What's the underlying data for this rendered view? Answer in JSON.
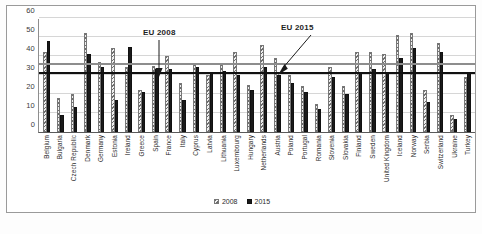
{
  "chart_data": {
    "type": "bar",
    "title": "",
    "xlabel": "",
    "ylabel": "",
    "ylim": [
      0,
      60
    ],
    "yticks": [
      0,
      10,
      20,
      30,
      40,
      50,
      60
    ],
    "grid": true,
    "legend_position": "bottom",
    "categories": [
      "Belgium",
      "Bulgaria",
      "Czech Republic",
      "Denmark",
      "Germany",
      "Estonia",
      "Ireland",
      "Greece",
      "Spain",
      "France",
      "Italy",
      "Cyprus",
      "Latvia",
      "Lithuania",
      "Luxembourg",
      "Hungary",
      "Netherlands",
      "Austria",
      "Poland",
      "Portugal",
      "Romania",
      "Slovenia",
      "Slovakia",
      "Finland",
      "Sweden",
      "United Kingdom",
      "Iceland",
      "Norway",
      "Serbia",
      "Switzerland",
      "Ukraine",
      "Turkey"
    ],
    "series": [
      {
        "name": "2008",
        "color": "#808080",
        "values": [
          42,
          18,
          20,
          52,
          37,
          44,
          34,
          22,
          35,
          40,
          26,
          36,
          30,
          36,
          42,
          25,
          46,
          39,
          30,
          24,
          15,
          34,
          24,
          42,
          42,
          41,
          51,
          52,
          22,
          47,
          9,
          29
        ]
      },
      {
        "name": "2015",
        "color": "#1a1a1a",
        "values": [
          48,
          9,
          13,
          41,
          34,
          17,
          45,
          21,
          33,
          33,
          17,
          34,
          31,
          32,
          30,
          22,
          34,
          30,
          26,
          21,
          12,
          29,
          20,
          31,
          33,
          31,
          39,
          44,
          16,
          42,
          7,
          31
        ]
      }
    ],
    "reference_lines": [
      {
        "label": "EU 2008",
        "value": 30.5,
        "color": "#111111"
      },
      {
        "label": "EU 2015",
        "value": 35.5,
        "color": "#8d8d8d"
      }
    ]
  },
  "annotations": {
    "eu2008": "EU 2008",
    "eu2015": "EU 2015"
  }
}
